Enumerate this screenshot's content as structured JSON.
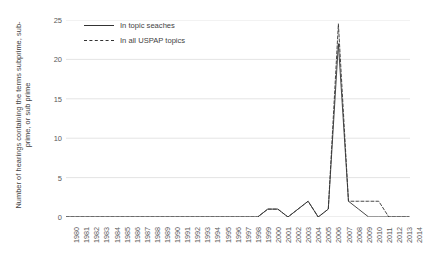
{
  "chart_data": {
    "type": "line",
    "title": "",
    "xlabel": "",
    "ylabel": "Number of hearings containing the terms subprime, sub-prime, or sub prime",
    "ylim": [
      0,
      25
    ],
    "yticks": [
      0,
      5,
      10,
      15,
      20,
      25
    ],
    "grid": "horizontal",
    "legend_position": "top-left-inside",
    "categories": [
      "1980",
      "1981",
      "1982",
      "1983",
      "1984",
      "1985",
      "1986",
      "1987",
      "1988",
      "1989",
      "1990",
      "1991",
      "1992",
      "1993",
      "1994",
      "1995",
      "1996",
      "1997",
      "1998",
      "1999",
      "2000",
      "2001",
      "2002",
      "2003",
      "2004",
      "2005",
      "2006",
      "2007",
      "2008",
      "2009",
      "2010",
      "2011",
      "2012",
      "2013",
      "2014"
    ],
    "series": [
      {
        "name": "In topic seaches",
        "style": "solid",
        "color": "#333333",
        "values": [
          0,
          0,
          0,
          0,
          0,
          0,
          0,
          0,
          0,
          0,
          0,
          0,
          0,
          0,
          0,
          0,
          0,
          0,
          0,
          0,
          1,
          1,
          0,
          1,
          2,
          0,
          1,
          22,
          2,
          1,
          0,
          0,
          0,
          0,
          0
        ]
      },
      {
        "name": "In all USPAP topics",
        "style": "dashed",
        "color": "#333333",
        "values": [
          0,
          0,
          0,
          0,
          0,
          0,
          0,
          0,
          0,
          0,
          0,
          0,
          0,
          0,
          0,
          0,
          0,
          0,
          0,
          0,
          1,
          1,
          0,
          1,
          2,
          0,
          1,
          24.5,
          2,
          2,
          2,
          2,
          0,
          0,
          0
        ]
      }
    ]
  },
  "legend": {
    "items": [
      {
        "label": "In topic seaches",
        "style": "solid"
      },
      {
        "label": "In all USPAP topics",
        "style": "dashed"
      }
    ]
  },
  "axis": {
    "y_title": "Number of hearings containing the terms subprime, sub-prime, or sub prime"
  }
}
